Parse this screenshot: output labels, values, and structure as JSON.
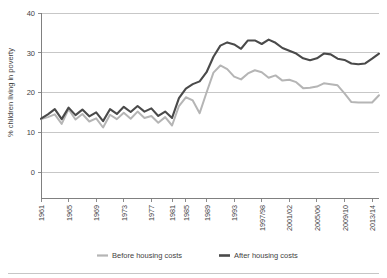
{
  "chart_data": {
    "type": "line",
    "title": "",
    "xlabel": "",
    "ylabel": "% children living in poverty",
    "ylim": [
      0,
      40
    ],
    "yticks": [
      0,
      10,
      20,
      30,
      40
    ],
    "ytick_labels": [
      "0",
      "10",
      "20",
      "30",
      "40"
    ],
    "grid": "horizontal",
    "legend_position": "bottom-center",
    "x": [
      "1961",
      "1962",
      "1963",
      "1964",
      "1965",
      "1966",
      "1967",
      "1968",
      "1969",
      "1970",
      "1971",
      "1972",
      "1973",
      "1974",
      "1975",
      "1976",
      "1977",
      "1978",
      "1979",
      "1981",
      "1983",
      "1985",
      "1987",
      "1988",
      "1989",
      "1990",
      "1991",
      "1992",
      "1993",
      "1994/95",
      "1995/96",
      "1996/97",
      "1997/98",
      "1998/99",
      "1999/00",
      "2000/01",
      "2001/02",
      "2002/03",
      "2003/04",
      "2004/05",
      "2005/06",
      "2006/07",
      "2007/08",
      "2008/09",
      "2009/10",
      "2010/11",
      "2011/12",
      "2012/13",
      "2013/14",
      "2014/15"
    ],
    "xtick_labels": [
      "1961",
      "1965",
      "1969",
      "1973",
      "1977",
      "1981",
      "1985",
      "1989",
      "1993",
      "1997/98",
      "2001/02",
      "2005/06",
      "2009/10",
      "2013/14"
    ],
    "xtick_indices": [
      0,
      4,
      8,
      12,
      16,
      19,
      21,
      24,
      28,
      32,
      36,
      40,
      44,
      48
    ],
    "series": [
      {
        "name": "Before housing costs",
        "color": "#b5b5b5",
        "values": [
          13.3,
          13.8,
          14.5,
          12.1,
          15.8,
          13.2,
          14.6,
          12.7,
          13.5,
          11.2,
          14.4,
          13.3,
          14.9,
          13.4,
          15.2,
          13.6,
          14.1,
          12.4,
          13.8,
          11.7,
          16.6,
          18.8,
          18.0,
          14.8,
          20.0,
          25.0,
          26.8,
          25.9,
          24.0,
          23.3,
          24.8,
          25.6,
          25.1,
          23.7,
          24.3,
          23.0,
          23.2,
          22.6,
          21.1,
          21.2,
          21.5,
          22.3,
          22.1,
          21.8,
          19.8,
          17.6,
          17.5,
          17.5,
          17.5,
          19.3
        ]
      },
      {
        "name": "After housing costs",
        "color": "#4a4a4a",
        "values": [
          13.4,
          14.5,
          15.8,
          13.3,
          16.2,
          14.3,
          15.7,
          14.0,
          15.0,
          12.8,
          15.8,
          14.6,
          16.4,
          15.1,
          16.6,
          15.2,
          16.0,
          14.1,
          15.2,
          13.6,
          18.6,
          21.0,
          22.1,
          22.8,
          25.1,
          29.0,
          31.8,
          32.6,
          32.1,
          31.0,
          33.1,
          33.1,
          32.2,
          33.3,
          32.5,
          31.2,
          30.5,
          29.8,
          28.6,
          28.1,
          28.6,
          29.8,
          29.6,
          28.5,
          28.2,
          27.3,
          27.1,
          27.3,
          28.5,
          29.8
        ]
      }
    ],
    "legend": [
      {
        "label": "Before housing costs",
        "color": "#b5b5b5"
      },
      {
        "label": "After housing costs",
        "color": "#4a4a4a"
      }
    ]
  }
}
